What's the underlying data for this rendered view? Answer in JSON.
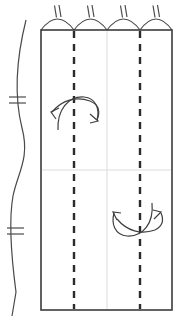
{
  "diagram": {
    "canvas": {
      "width": 187,
      "height": 319,
      "background": "#ffffff"
    },
    "colors": {
      "outline": "#3b3b3b",
      "dashed": "#2b2b2b",
      "faint_guide": "#dcdcdc",
      "arrow": "#3f3f3f",
      "tick": "#4a4a4a"
    },
    "panel": {
      "name": "main-rectangle",
      "x": 41,
      "y": 30,
      "width": 131,
      "height": 280,
      "stroke_width": 1.6
    },
    "dashed_fold_lines": [
      {
        "name": "fold-line-left",
        "x": 74,
        "y1": 31,
        "y2": 309,
        "stroke_width": 2.4,
        "dash": "7 6"
      },
      {
        "name": "fold-line-right",
        "x": 140,
        "y1": 31,
        "y2": 309,
        "stroke_width": 2.4,
        "dash": "7 6"
      }
    ],
    "guide_lines": [
      {
        "name": "center-vertical-guide",
        "orientation": "vertical",
        "x": 107,
        "y1": 31,
        "y2": 309,
        "stroke_width": 1
      },
      {
        "name": "mid-horizontal-guide",
        "orientation": "horizontal",
        "y": 170,
        "x1": 42,
        "x2": 171,
        "stroke_width": 1
      }
    ],
    "top_arcs": {
      "name": "pleat-arc-group",
      "count": 4,
      "baseline_y": 30,
      "arc_height": 16,
      "stroke_width": 1.1,
      "spans": [
        {
          "x1": 41,
          "x2": 74
        },
        {
          "x1": 74,
          "x2": 107
        },
        {
          "x1": 107,
          "x2": 140
        },
        {
          "x1": 140,
          "x2": 172
        }
      ],
      "tick_label": "double-tick",
      "ticks_per_arc": 2
    },
    "left_wavy_line": {
      "name": "selvage-wavy-edge",
      "stroke_width": 1.2,
      "path": "M 26 20 C 16 60, 14 96, 22 128 C 30 158, 18 172, 13 196 C 8 224, 12 262, 16 292 L 12 316",
      "ticks": [
        {
          "name": "wavy-tick-upper",
          "y": 100,
          "x": 18,
          "marks": 2
        },
        {
          "name": "wavy-tick-lower",
          "y": 231,
          "x": 15,
          "marks": 2
        }
      ]
    },
    "arrows": [
      {
        "name": "upper-drape-arrow",
        "direction": "double-headed-arc-up",
        "quadrant": "upper-left",
        "stroke_width": 1.2,
        "path": "M 57 127 C 58 104, 78 94, 92 99 C 102 103, 98 112, 95 119",
        "heads": [
          {
            "name": "arrowhead-upper-left",
            "x": 53,
            "y": 113,
            "angle": -115
          },
          {
            "name": "arrowhead-upper-right",
            "x": 95,
            "y": 121,
            "angle": 65
          }
        ]
      },
      {
        "name": "lower-drape-arrow",
        "direction": "double-headed-arc-down",
        "quadrant": "lower-right",
        "stroke_width": 1.2,
        "path": "M 124 205 C 122 230, 140 242, 152 236 C 160 231, 158 222, 155 216",
        "heads": [
          {
            "name": "arrowhead-lower-left",
            "x": 120,
            "y": 214,
            "angle": 250
          },
          {
            "name": "arrowhead-lower-right",
            "x": 156,
            "y": 214,
            "angle": 300
          }
        ]
      }
    ]
  }
}
